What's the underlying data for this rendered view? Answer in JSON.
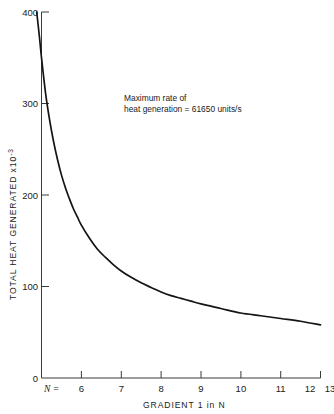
{
  "chart_data": {
    "type": "line",
    "title": "",
    "xlabel": "GRADIENT  1 in N",
    "ylabel": "TOTAL HEAT GENERATED  x10",
    "ylabel_exponent": "-3",
    "xlim": [
      6,
      13
    ],
    "ylim": [
      0,
      400
    ],
    "xticks": [
      6,
      7,
      8,
      9,
      10,
      11,
      12,
      13
    ],
    "xtick_labels": [
      "6",
      "7",
      "8",
      "9",
      "10",
      "11",
      "12",
      "13"
    ],
    "yticks": [
      0,
      100,
      200,
      300,
      400
    ],
    "ytick_labels": [
      "0",
      "100",
      "200",
      "300",
      "400"
    ],
    "grid": false,
    "legend": "none",
    "series": [
      {
        "name": "Total heat generated",
        "color": "#141414",
        "x": [
          5.88,
          5.95,
          6.0,
          6.1,
          6.2,
          6.3,
          6.4,
          6.5,
          6.6,
          6.7,
          6.8,
          6.9,
          7.0,
          7.2,
          7.4,
          7.6,
          7.8,
          8.0,
          8.25,
          8.5,
          8.75,
          9.0,
          9.25,
          9.5,
          9.75,
          10.0,
          10.5,
          11.0,
          11.5,
          12.0,
          12.5,
          13.0
        ],
        "y": [
          400,
          372,
          350,
          312,
          283,
          259,
          239,
          222,
          208,
          196,
          185,
          176,
          167,
          153,
          141,
          132,
          124,
          117,
          110,
          104,
          99,
          94,
          90,
          87,
          84,
          81,
          76,
          71,
          68,
          65,
          62,
          58
        ]
      }
    ],
    "annotations": [
      {
        "name": "max-rate-note",
        "line1": "Maximum rate of",
        "line2_prefix": "heat generation ",
        "line2_equals": "=",
        "line2_value": "61650 units/s",
        "x_px": 124,
        "y_px": 98
      }
    ],
    "axis_prefix_label": "N =",
    "x_variable_symbol": "N"
  }
}
